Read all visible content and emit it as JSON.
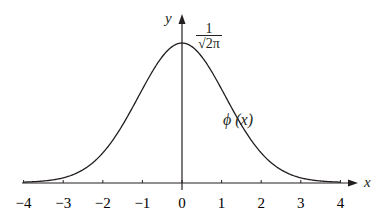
{
  "chart_data": {
    "type": "line",
    "title": "",
    "xlabel": "x",
    "ylabel": "y",
    "xlim": [
      -4,
      4
    ],
    "xticks": [
      "−4",
      "−3",
      "−2",
      "−1",
      "0",
      "1",
      "2",
      "3",
      "4"
    ],
    "peak_label_numerator": "1",
    "peak_label_denominator": "√2π",
    "curve_label": "ϕ (x)",
    "series": [
      {
        "name": "ϕ(x)",
        "x": [
          -4,
          -3.5,
          -3,
          -2.5,
          -2,
          -1.5,
          -1,
          -0.5,
          0,
          0.5,
          1,
          1.5,
          2,
          2.5,
          3,
          3.5,
          4
        ],
        "values": [
          0.0001,
          0.0009,
          0.0044,
          0.0175,
          0.054,
          0.1295,
          0.242,
          0.3521,
          0.3989,
          0.3521,
          0.242,
          0.1295,
          0.054,
          0.0175,
          0.0044,
          0.0009,
          0.0001
        ]
      }
    ],
    "grid": false,
    "legend": "none"
  }
}
